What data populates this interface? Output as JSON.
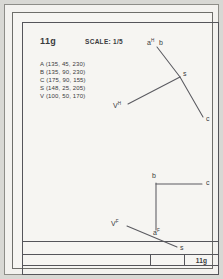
{
  "sheet": {
    "drawing_number": "11g",
    "scale_label": "SCALE: 1/5",
    "title_block_id": "11g"
  },
  "coordinates": {
    "lines": [
      "A (135, 45, 230)",
      "B (135, 90, 230)",
      "C (175, 90, 155)",
      "S (148, 25, 205)",
      "V (100, 50, 170)"
    ],
    "points": [
      {
        "name": "A",
        "x": 135,
        "y": 45,
        "z": 230
      },
      {
        "name": "B",
        "x": 135,
        "y": 90,
        "z": 230
      },
      {
        "name": "C",
        "x": 175,
        "y": 90,
        "z": 155
      },
      {
        "name": "S",
        "x": 148,
        "y": 25,
        "z": 205
      },
      {
        "name": "V",
        "x": 100,
        "y": 50,
        "z": 170
      }
    ]
  },
  "views": {
    "horizontal": {
      "name": "horizontal-projection-view",
      "labels": {
        "a_h": "a",
        "a_h_sup": "H",
        "b": "b",
        "s": "s",
        "c": "c",
        "v_h": "V",
        "v_h_sup": "H"
      }
    },
    "frontal": {
      "name": "frontal-projection-view",
      "labels": {
        "b": "b",
        "c": "c",
        "a_f": "a",
        "a_f_sup": "F",
        "v_f": "V",
        "v_f_sup": "F",
        "s": "s"
      }
    }
  },
  "style": {
    "line_color": "#5a5a60",
    "text_color": "#3a3a3d",
    "paper": "#f6f5f2"
  }
}
